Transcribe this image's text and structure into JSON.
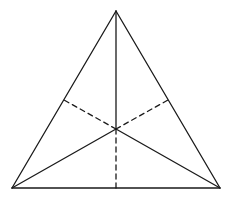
{
  "diagram": {
    "type": "geometry",
    "colors": {
      "background": "#ffffff",
      "stroke": "#1a1a1a"
    },
    "points": {
      "A": [
        116,
        11
      ],
      "B": [
        12,
        188
      ],
      "C": [
        220,
        188
      ],
      "O": [
        116,
        129
      ],
      "D_left": [
        64,
        100
      ],
      "E_right": [
        168,
        100
      ],
      "F_bottom": [
        116,
        188
      ]
    },
    "solid_segments": [
      [
        "A",
        "B"
      ],
      [
        "B",
        "C"
      ],
      [
        "C",
        "A"
      ],
      [
        "O",
        "A"
      ],
      [
        "O",
        "B"
      ],
      [
        "O",
        "C"
      ]
    ],
    "dashed_segments": [
      [
        "O",
        "D_left"
      ],
      [
        "O",
        "E_right"
      ],
      [
        "O",
        "F_bottom"
      ]
    ],
    "labels": []
  }
}
